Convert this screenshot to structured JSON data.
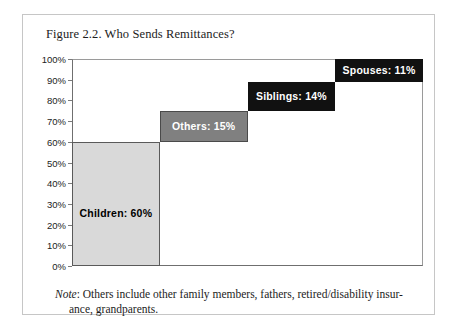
{
  "figure": {
    "title": "Figure 2.2. Who Sends Remittances?",
    "note_label": "Note",
    "note_sep": ": ",
    "note_line1": "Others include other family members, fathers, retired/disability insur-",
    "note_line2": "ance, grandparents."
  },
  "chart_data": {
    "type": "bar",
    "chart_subtype": "waterfall",
    "title": "Figure 2.2. Who Sends Remittances?",
    "xlabel": "",
    "ylabel": "",
    "ylim": [
      0,
      100
    ],
    "y_unit": "%",
    "y_tick_step": 10,
    "grid": false,
    "legend": "none",
    "categories": [
      "Children",
      "Siblings",
      "Others",
      "Spouses"
    ],
    "values": [
      60,
      14,
      15,
      11
    ],
    "bars": [
      {
        "label": "Children: 60%",
        "category": "Children",
        "value": 60,
        "base": 0,
        "top": 60,
        "fill": "#d9d9d9",
        "text_color": "#000000",
        "order": 1
      },
      {
        "label": "Others: 15%",
        "category": "Others",
        "value": 15,
        "base": 60,
        "top": 75,
        "fill": "#808080",
        "text_color": "#ffffff",
        "order": 2
      },
      {
        "label": "Siblings: 14%",
        "category": "Siblings",
        "value": 14,
        "base": 75,
        "top": 89,
        "fill": "#111111",
        "text_color": "#ffffff",
        "order": 3
      },
      {
        "label": "Spouses: 11%",
        "category": "Spouses",
        "value": 11,
        "base": 89,
        "top": 100,
        "fill": "#111111",
        "text_color": "#ffffff",
        "order": 4
      }
    ],
    "y_ticks": [
      "100%",
      "90%",
      "80%",
      "70%",
      "60%",
      "50%",
      "40%",
      "30%",
      "20%",
      "10%",
      "0%"
    ],
    "y_tick_values": [
      100,
      90,
      80,
      70,
      60,
      50,
      40,
      30,
      20,
      10,
      0
    ],
    "total": 100
  },
  "colors": {
    "card_border": "#c6c6c6",
    "axis": "#6f6f6f",
    "frame": "#9a9a9a",
    "bar_light": "#d9d9d9",
    "bar_mid": "#808080",
    "bar_dark": "#111111",
    "text": "#1c1c1c",
    "background": "#ffffff"
  }
}
